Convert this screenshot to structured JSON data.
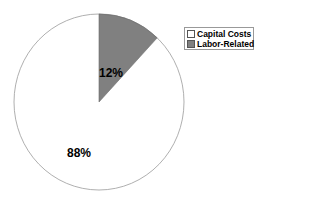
{
  "chart_data": {
    "type": "pie",
    "title": "",
    "categories": [
      "Capital Costs",
      "Labor-Related"
    ],
    "values": [
      88,
      12
    ],
    "labels": [
      "88%",
      "12%"
    ],
    "colors": [
      "#ffffff",
      "#808080"
    ],
    "start_angle_deg": 0,
    "legend_position": "right",
    "units": "%"
  },
  "legend": {
    "items": [
      {
        "label": "Capital Costs",
        "color": "#ffffff"
      },
      {
        "label": "Labor-Related",
        "color": "#808080"
      }
    ]
  },
  "slice_labels": {
    "capital": "88%",
    "labor": "12%"
  }
}
